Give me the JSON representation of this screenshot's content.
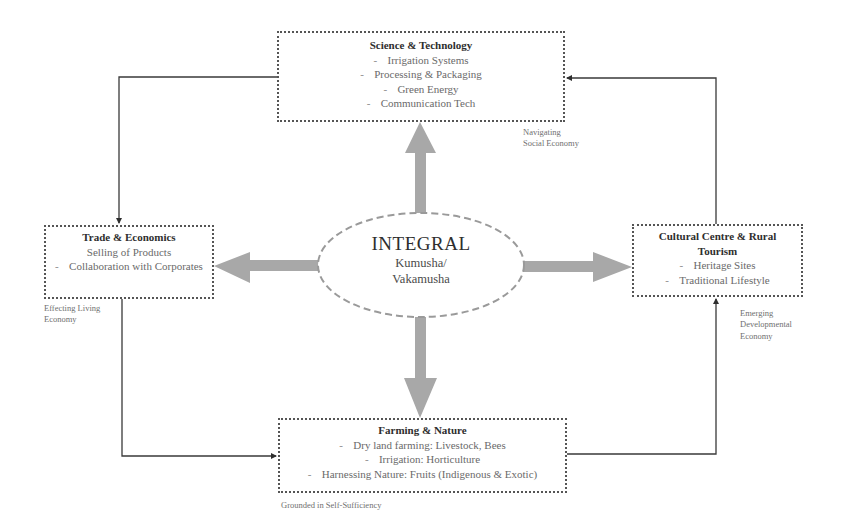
{
  "diagram": {
    "center": {
      "title": "INTEGRAL",
      "subtitle_line1": "Kumusha/",
      "subtitle_line2": "Vakamusha"
    },
    "nodes": {
      "science": {
        "title": "Science & Technology",
        "items": [
          "Irrigation Systems",
          "Processing & Packaging",
          "Green Energy",
          "Communication Tech"
        ]
      },
      "trade": {
        "title": "Trade & Economics",
        "items": [
          "Selling of Products",
          "Collaboration with Corporates"
        ]
      },
      "cultural": {
        "title": "Cultural Centre & Rural Tourism",
        "items": [
          "Heritage Sites",
          "Traditional Lifestyle"
        ]
      },
      "farming": {
        "title": "Farming & Nature",
        "items": [
          "Dry land farming: Livestock, Bees",
          "Irrigation: Horticulture",
          "Harnessing Nature: Fruits (Indigenous & Exotic)"
        ]
      }
    },
    "captions": {
      "navigating": "Navigating Social Economy",
      "living": "Effecting Living Economy",
      "emerging": "Emerging Developmental Economy",
      "grounded": "Grounded in Self-Sufficiency"
    },
    "bullet": "-",
    "colors": {
      "arrow_fill": "#a8a8a8",
      "connector": "#3a3a3a",
      "box_border": "#555555",
      "ellipse_border": "#9a9a9a"
    }
  }
}
